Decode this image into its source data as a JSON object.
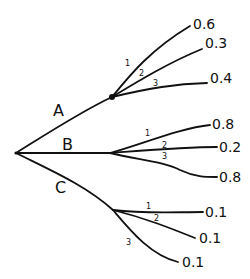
{
  "diagram": {
    "type": "probability-tree",
    "root": {
      "x": 16,
      "y": 153
    },
    "branches": [
      {
        "label": "A",
        "label_pos": {
          "x": 53,
          "y": 116
        },
        "node": {
          "x": 112,
          "y": 97,
          "marked": true
        },
        "path": "M16,153 C45,135 80,112 112,97",
        "children": [
          {
            "index": "1",
            "prob": "0.6",
            "index_pos": {
              "x": 125,
              "y": 66
            },
            "prob_pos": {
              "x": 193,
              "y": 29
            },
            "path": "M112,97 C130,75 150,50 190,26"
          },
          {
            "index": "2",
            "prob": "0.3",
            "index_pos": {
              "x": 139,
              "y": 76
            },
            "prob_pos": {
              "x": 205,
              "y": 48
            },
            "path": "M112,97 C140,80 170,62 202,49"
          },
          {
            "index": "3",
            "prob": "0.4",
            "index_pos": {
              "x": 153,
              "y": 86
            },
            "prob_pos": {
              "x": 210,
              "y": 83
            },
            "path": "M112,97 C150,88 175,84 207,83"
          }
        ]
      },
      {
        "label": "B",
        "label_pos": {
          "x": 62,
          "y": 150
        },
        "node": {
          "x": 110,
          "y": 153,
          "marked": false
        },
        "path": "M16,153 C50,153 80,153 110,153",
        "children": [
          {
            "index": "1",
            "prob": "0.8",
            "index_pos": {
              "x": 145,
              "y": 136
            },
            "prob_pos": {
              "x": 212,
              "y": 129
            },
            "path": "M110,153 C140,145 180,128 210,125"
          },
          {
            "index": "2",
            "prob": "0.2",
            "index_pos": {
              "x": 162,
              "y": 148
            },
            "prob_pos": {
              "x": 219,
              "y": 152
            },
            "path": "M110,153 C150,150 185,147 217,147"
          },
          {
            "index": "3",
            "prob": "0.8",
            "index_pos": {
              "x": 162,
              "y": 159
            },
            "prob_pos": {
              "x": 219,
              "y": 182
            },
            "path": "M110,153 C140,160 165,162 180,170 C195,177 205,177 217,177"
          }
        ]
      },
      {
        "label": "C",
        "label_pos": {
          "x": 55,
          "y": 193
        },
        "node": {
          "x": 113,
          "y": 210,
          "marked": false
        },
        "path": "M16,153 C50,170 85,185 113,210",
        "children": [
          {
            "index": "1",
            "prob": "0.1",
            "index_pos": {
              "x": 146,
              "y": 209
            },
            "prob_pos": {
              "x": 205,
              "y": 217
            },
            "path": "M113,210 C145,214 175,212 203,212"
          },
          {
            "index": "2",
            "prob": "0.1",
            "index_pos": {
              "x": 154,
              "y": 221
            },
            "prob_pos": {
              "x": 199,
              "y": 243
            },
            "path": "M113,210 C145,218 170,228 195,238"
          },
          {
            "index": "3",
            "prob": "0.1",
            "index_pos": {
              "x": 126,
              "y": 245
            },
            "prob_pos": {
              "x": 182,
              "y": 267
            },
            "path": "M113,210 C130,230 150,255 178,262"
          }
        ]
      }
    ]
  }
}
